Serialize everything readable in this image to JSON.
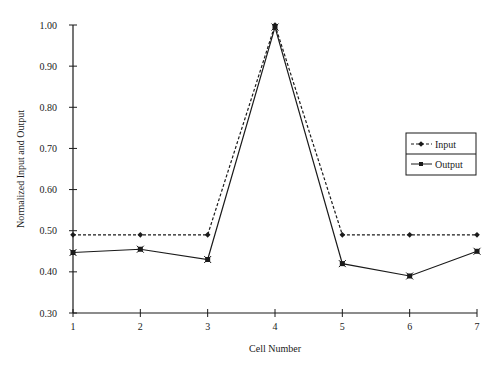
{
  "chart_data": {
    "type": "line",
    "title": "",
    "xlabel": "Cell Number",
    "ylabel": "Normalized Input and Output",
    "x": [
      1,
      2,
      3,
      4,
      5,
      6,
      7
    ],
    "x_tick_labels": [
      "1",
      "2",
      "3",
      "4",
      "5",
      "6",
      "7"
    ],
    "y_tick_labels": [
      "0.30",
      "0.40",
      "0.50",
      "0.60",
      "0.70",
      "0.80",
      "0.90",
      "1.00"
    ],
    "ylim": [
      0.3,
      1.0
    ],
    "xlim": [
      1,
      7
    ],
    "grid": false,
    "legend_position": "right",
    "series": [
      {
        "name": "Input",
        "line_style": "dashed",
        "marker": "diamond",
        "values": [
          0.49,
          0.49,
          0.49,
          1.0,
          0.49,
          0.49,
          0.49
        ]
      },
      {
        "name": "Output",
        "line_style": "solid",
        "marker": "x-square",
        "values": [
          0.447,
          0.455,
          0.43,
          0.995,
          0.42,
          0.39,
          0.45
        ]
      }
    ]
  },
  "legend": {
    "items": [
      "Input",
      "Output"
    ]
  },
  "colors": {
    "line": "#1a1a1a",
    "background": "#ffffff"
  }
}
